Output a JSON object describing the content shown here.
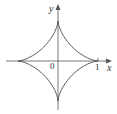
{
  "diagram": {
    "title": "",
    "curve": "astroid",
    "equation": "x^(2/3) + y^(2/3) = 1",
    "labels": {
      "x_axis": "x",
      "y_axis": "y",
      "origin": "0",
      "x_tick": "1"
    },
    "colors": {
      "curve": "#444444",
      "axes": "#555555",
      "background": "#ffffff"
    },
    "geometry": {
      "origin_px": [
        58,
        61
      ],
      "radius_px": 40,
      "x_axis_range_px": [
        6,
        112
      ],
      "y_axis_range_px": [
        4,
        110
      ],
      "cusps": [
        [
          1,
          0
        ],
        [
          0,
          1
        ],
        [
          -1,
          0
        ],
        [
          0,
          -1
        ]
      ]
    }
  }
}
